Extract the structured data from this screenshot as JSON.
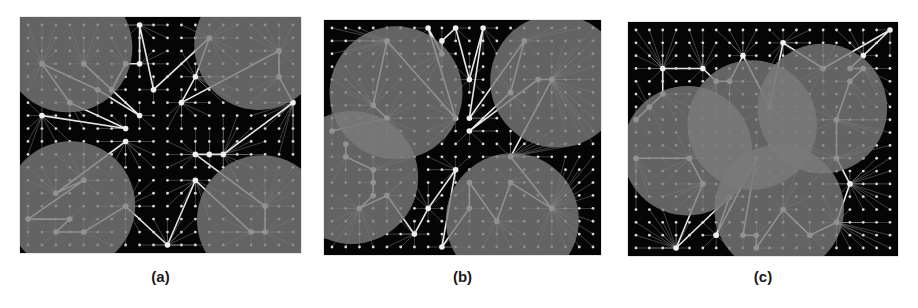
{
  "figure": {
    "panels": [
      {
        "id": "a",
        "label": "(a)",
        "box": {
          "x": 20,
          "y": 17,
          "w": 281,
          "h": 236
        },
        "circles": [
          {
            "cx": 0.17,
            "cy": 0.13,
            "r": 0.23
          },
          {
            "cx": 0.85,
            "cy": 0.12,
            "r": 0.23
          },
          {
            "cx": 0.18,
            "cy": 0.8,
            "r": 0.23
          },
          {
            "cx": 0.86,
            "cy": 0.86,
            "r": 0.23
          }
        ]
      },
      {
        "id": "b",
        "label": "(b)",
        "box": {
          "x": 324,
          "y": 20,
          "w": 277,
          "h": 235
        },
        "circles": [
          {
            "cx": 0.26,
            "cy": 0.31,
            "r": 0.24
          },
          {
            "cx": 0.84,
            "cy": 0.26,
            "r": 0.24
          },
          {
            "cx": 0.1,
            "cy": 0.67,
            "r": 0.24
          },
          {
            "cx": 0.68,
            "cy": 0.85,
            "r": 0.24
          }
        ]
      },
      {
        "id": "c",
        "label": "(c)",
        "box": {
          "x": 628,
          "y": 22,
          "w": 270,
          "h": 234
        },
        "circles": [
          {
            "cx": 0.22,
            "cy": 0.55,
            "r": 0.24
          },
          {
            "cx": 0.46,
            "cy": 0.44,
            "r": 0.24
          },
          {
            "cx": 0.72,
            "cy": 0.37,
            "r": 0.24
          },
          {
            "cx": 0.56,
            "cy": 0.8,
            "r": 0.24
          }
        ]
      }
    ],
    "colors": {
      "background": "#050505",
      "grid_node": "#d8d8d8",
      "edge": "#bdbdbd",
      "path": "#e6e6e6",
      "circle_fill": "#7a7a7a"
    },
    "grid": {
      "cols": 20,
      "rows": 18
    }
  }
}
